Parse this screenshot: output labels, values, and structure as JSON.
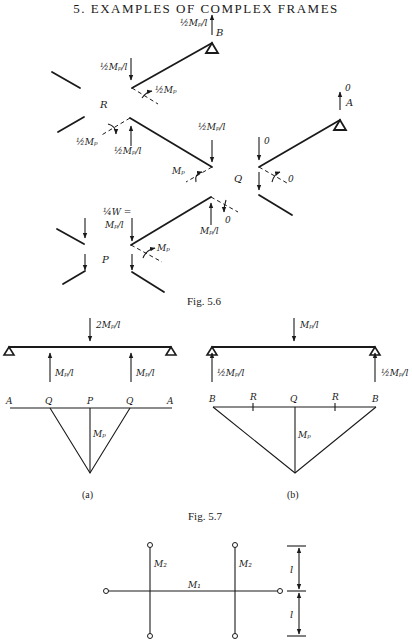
{
  "page": {
    "header": "5. EXAMPLES OF COMPLEX FRAMES"
  },
  "fig56": {
    "caption": "Fig. 5.6",
    "joints": {
      "A": "A",
      "B": "B",
      "P": "P",
      "Q": "Q",
      "R": "R"
    },
    "loads": {
      "b_reaction": "½Mₚ/l",
      "r_top_shear": "½Mₚ/l",
      "r_top_moment": "½Mₚ",
      "r_left_moment": "½Mₚ",
      "r_bottom_shear": "½Mₚ/l",
      "q_top_shear": "½Mₚ/l",
      "q_left_moment": "Mₚ",
      "q_bottom_shear": "Mₚ/l",
      "q_bottom_moment": "0",
      "a_reaction": "0",
      "a_arm_shear": "0",
      "a_arm_moment": "0",
      "p_load_line1": "¼W =",
      "p_load_line2": "Mₚ/l",
      "p_moment": "Mₚ"
    }
  },
  "fig57": {
    "caption": "Fig. 5.7",
    "a": {
      "label": "(a)",
      "top_load": "2Mₚ/l",
      "left_reaction": "Mₚ/l",
      "right_reaction": "Mₚ/l",
      "points": [
        "A",
        "Q",
        "P",
        "Q",
        "A"
      ],
      "moment_label": "Mₚ"
    },
    "b": {
      "label": "(b)",
      "top_load": "Mₚ/l",
      "left_reaction": "½Mₚ/l",
      "right_reaction": "½Mₚ/l",
      "points": [
        "B",
        "R",
        "Q",
        "R",
        "B"
      ],
      "moment_label": "Mₚ"
    }
  },
  "fig58": {
    "beam_labels": {
      "vertical_left": "M₂",
      "horizontal": "M₁",
      "vertical_right": "M₂"
    },
    "dimensions": {
      "upper": "l",
      "lower": "l"
    }
  }
}
